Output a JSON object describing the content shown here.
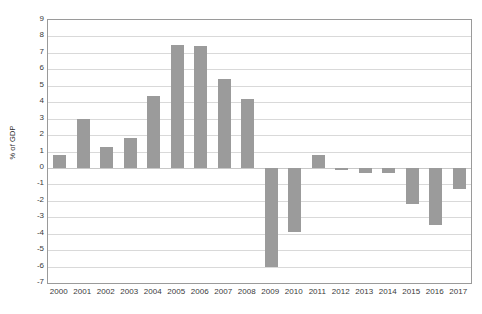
{
  "chart_data": {
    "type": "bar",
    "title": "",
    "subtitle": "",
    "xlabel": "",
    "ylabel": "% of GDP",
    "categories": [
      "2000",
      "2001",
      "2002",
      "2003",
      "2004",
      "2005",
      "2006",
      "2007",
      "2008",
      "2009",
      "2010",
      "2011",
      "2012",
      "2013",
      "2014",
      "2015",
      "2016",
      "2017"
    ],
    "values": [
      0.8,
      3.0,
      1.3,
      1.8,
      4.4,
      7.5,
      7.4,
      5.4,
      4.2,
      -6.0,
      -3.9,
      0.8,
      -0.1,
      -0.3,
      -0.3,
      -2.2,
      -3.5,
      -1.3
    ],
    "ylim": [
      -7,
      9
    ],
    "y_ticks": [
      9,
      8,
      7,
      6,
      5,
      4,
      3,
      2,
      1,
      0,
      -1,
      -2,
      -3,
      -4,
      -5,
      -6,
      -7
    ],
    "y_tick_labels": [
      "9",
      "8",
      "7",
      "6",
      "5",
      "4",
      "3",
      "2",
      "1",
      "0",
      "-1",
      "-2",
      "-3",
      "-4",
      "-5",
      "-6",
      "-7"
    ],
    "grid": true,
    "legend": false,
    "legend_position": "none",
    "annotations": [],
    "bar_color": "#9b9b9b",
    "gridline_color": "#d9d9d9",
    "axis_border_color": "#9a9a9a",
    "background_color": "#ffffff",
    "text_color": "#3a3a3a"
  }
}
